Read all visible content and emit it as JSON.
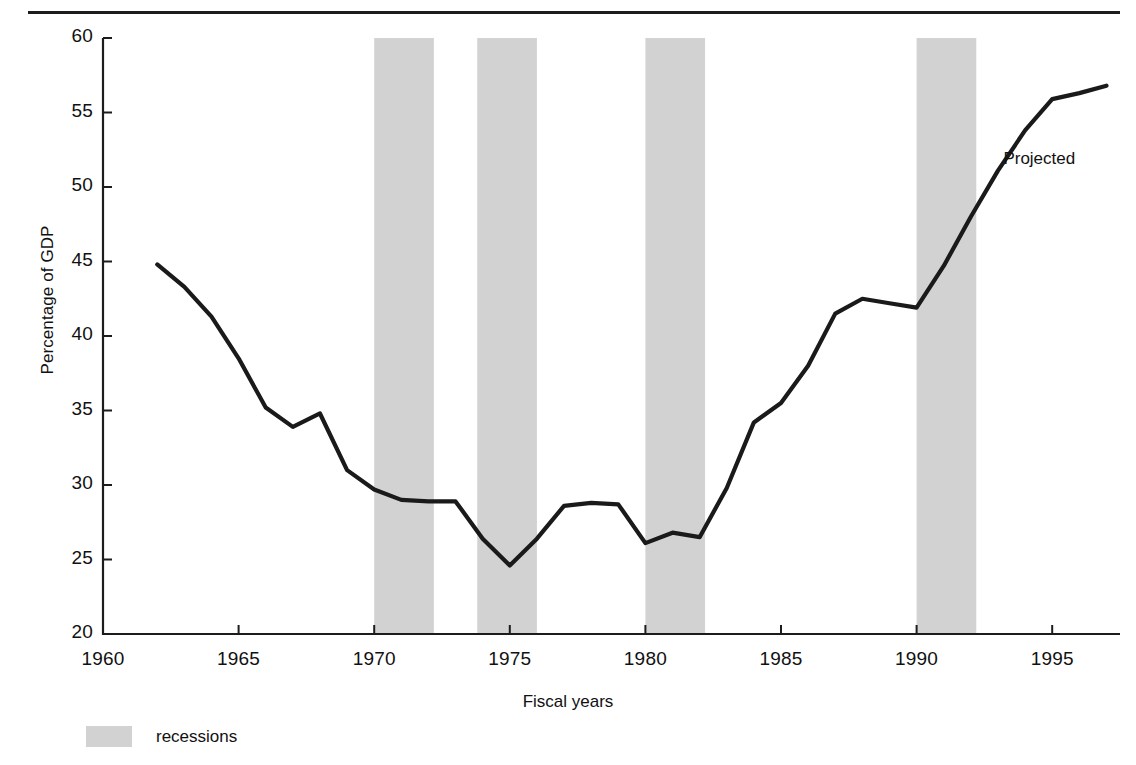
{
  "figure": {
    "top_rule": true,
    "background": "#ffffff",
    "line_color": "#1a1a1a",
    "recession_color": "#d2d2d2",
    "axis_color": "#1c1c1c"
  },
  "annotation": {
    "projected_label": "Projected"
  },
  "legend": {
    "swatch_color": "#d2d2d2",
    "label": "recessions"
  },
  "chart_data": {
    "type": "line",
    "title": "",
    "xlabel": "Fiscal years",
    "ylabel": "Percentage of GDP",
    "xlim": [
      1960,
      1997.5
    ],
    "ylim": [
      20,
      60
    ],
    "grid": false,
    "legend_position": "below-axis-left",
    "xticks": [
      1960,
      1965,
      1970,
      1975,
      1980,
      1985,
      1990,
      1995
    ],
    "xtick_labels": [
      "1960",
      "1965",
      "1970",
      "1975",
      "1980",
      "1985",
      "1990",
      "1995"
    ],
    "yticks": [
      20,
      25,
      30,
      35,
      40,
      45,
      50,
      55,
      60
    ],
    "ytick_labels": [
      "20",
      "25",
      "30",
      "35",
      "40",
      "45",
      "50",
      "55",
      "60"
    ],
    "series": [
      {
        "name": "Federal debt held by the public",
        "color": "#1a1a1a",
        "x": [
          1962.0,
          1963.0,
          1964.0,
          1965.0,
          1966.0,
          1967.0,
          1968.0,
          1969.0,
          1970.0,
          1971.0,
          1972.0,
          1973.0,
          1974.0,
          1975.0,
          1976.0,
          1977.0,
          1978.0,
          1979.0,
          1980.0,
          1981.0,
          1982.0,
          1983.0,
          1984.0,
          1985.0,
          1986.0,
          1987.0,
          1988.0,
          1989.0,
          1990.0,
          1991.0,
          1992.0,
          1993.0,
          1994.0,
          1995.0,
          1996.0,
          1997.0
        ],
        "y": [
          44.8,
          43.3,
          41.3,
          38.5,
          35.2,
          33.9,
          34.8,
          31.0,
          29.7,
          29.0,
          28.9,
          28.9,
          26.4,
          24.6,
          26.4,
          28.6,
          28.8,
          28.7,
          26.1,
          26.8,
          26.5,
          29.8,
          34.2,
          35.5,
          38.0,
          41.5,
          42.5,
          42.2,
          41.9,
          44.7,
          48.0,
          51.1,
          53.8,
          55.9,
          56.3,
          56.8
        ]
      }
    ],
    "recession_bands": [
      {
        "start": 1970.0,
        "end": 1972.2
      },
      {
        "start": 1973.8,
        "end": 1976.0
      },
      {
        "start": 1980.0,
        "end": 1982.2
      },
      {
        "start": 1990.0,
        "end": 1992.2
      }
    ],
    "annotations": [
      {
        "text": "Projected",
        "x": 1993.2,
        "y": 51.8
      }
    ]
  }
}
